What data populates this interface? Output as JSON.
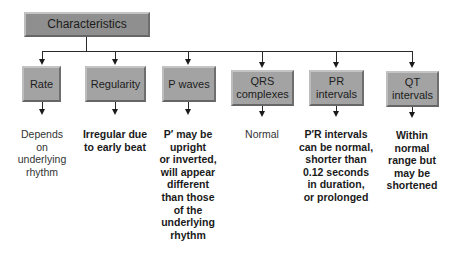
{
  "root": {
    "label": "Characteristics"
  },
  "branches": [
    {
      "label": "Rate",
      "description": "Depends\non\nunderlying\nrhythm"
    },
    {
      "label": "Regularity",
      "description": "Irregular due\nto early beat"
    },
    {
      "label": "P waves",
      "description": "P′ may be\nupright\nor inverted,\nwill appear\ndifferent\nthan those\nof the\nunderlying\nrhythm"
    },
    {
      "label": "QRS\ncomplexes",
      "description": "Normal"
    },
    {
      "label": "PR\nintervals",
      "description": "P′R intervals\ncan be normal,\nshorter than\n0.12 seconds\nin duration,\nor prolonged"
    },
    {
      "label": "QT\nintervals",
      "description": "Within\nnormal\nrange but\nmay be\nshortened"
    }
  ],
  "colors": {
    "box": "#a3a3a3",
    "root_box": "#8f8f8f",
    "lines": "#2a2a2a"
  }
}
